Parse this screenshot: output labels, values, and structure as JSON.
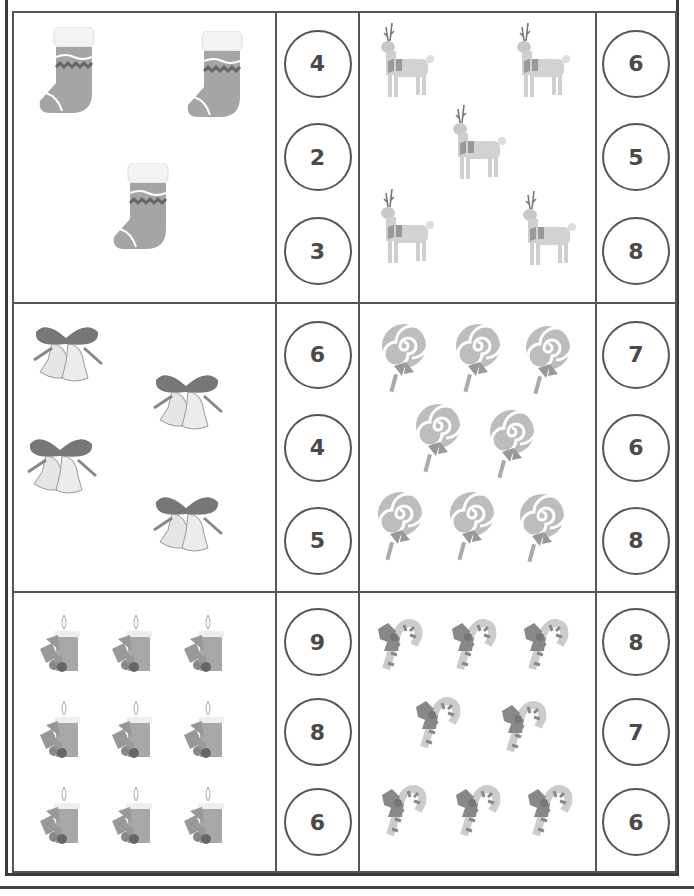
{
  "worksheet": {
    "instructions": "Count the pictures and circle the correct number",
    "rows": [
      {
        "left": {
          "item": "stocking",
          "count": 3,
          "icon": "stocking-icon",
          "options": [
            "4",
            "2",
            "3"
          ]
        },
        "right": {
          "item": "reindeer",
          "count": 5,
          "icon": "reindeer-icon",
          "options": [
            "6",
            "5",
            "8"
          ]
        }
      },
      {
        "left": {
          "item": "bells",
          "count": 4,
          "icon": "bells-icon",
          "options": [
            "6",
            "4",
            "5"
          ]
        },
        "right": {
          "item": "lollipop",
          "count": 8,
          "icon": "lollipop-icon",
          "options": [
            "7",
            "6",
            "8"
          ]
        }
      },
      {
        "left": {
          "item": "candle",
          "count": 9,
          "icon": "candle-icon",
          "options": [
            "9",
            "8",
            "6"
          ]
        },
        "right": {
          "item": "candy-cane",
          "count": 8,
          "icon": "candy-cane-icon",
          "options": [
            "8",
            "7",
            "6"
          ]
        }
      }
    ]
  },
  "colors": {
    "line": "#555555",
    "text": "#4a4a4a",
    "item_gray": "#9a9a9a",
    "item_dark": "#6e6e6e"
  }
}
